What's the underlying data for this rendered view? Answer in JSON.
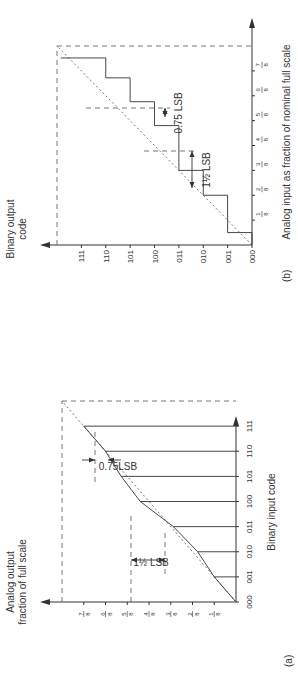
{
  "figure": {
    "panel_a": {
      "tag": "(a)",
      "y_label_line1": "Analog output",
      "y_label_line2": "fraction of full scale",
      "x_label": "Binary input code",
      "codes": [
        "000",
        "001",
        "010",
        "011",
        "100",
        "101",
        "110",
        "111"
      ],
      "y_ticks": [
        {
          "num": "1",
          "den": "8"
        },
        {
          "num": "2",
          "den": "8"
        },
        {
          "num": "3",
          "den": "8"
        },
        {
          "num": "4",
          "den": "8"
        },
        {
          "num": "5",
          "den": "8"
        },
        {
          "num": "6",
          "den": "8"
        },
        {
          "num": "7",
          "den": "8"
        }
      ],
      "ideal_line": "dashed diagonal from 000 to full scale",
      "actual_outputs_fraction": [
        0,
        0.125,
        0.22,
        0.36,
        0.55,
        0.66,
        0.75,
        0.875
      ],
      "annotation_1": "1½ LSB",
      "annotation_2": "0.75LSB"
    },
    "panel_b": {
      "tag": "(b)",
      "y_label_line1": "Binary output",
      "y_label_line2": "code",
      "x_label": "Analog input as fraction of nominal full scale",
      "codes": [
        "000",
        "001",
        "010",
        "011",
        "100",
        "101",
        "110",
        "111"
      ],
      "x_ticks": [
        {
          "num": "1",
          "den": "8"
        },
        {
          "num": "2",
          "den": "8"
        },
        {
          "num": "3",
          "den": "8"
        },
        {
          "num": "4",
          "den": "8"
        },
        {
          "num": "5",
          "den": "8"
        },
        {
          "num": "6",
          "den": "8"
        },
        {
          "num": "7",
          "den": "8"
        }
      ],
      "transition_points_fraction": [
        0.0625,
        0.25,
        0.375,
        0.6,
        0.72,
        0.84,
        0.94
      ],
      "annotation_1": "1½ LSB",
      "annotation_2": "0.75 LSB"
    }
  }
}
